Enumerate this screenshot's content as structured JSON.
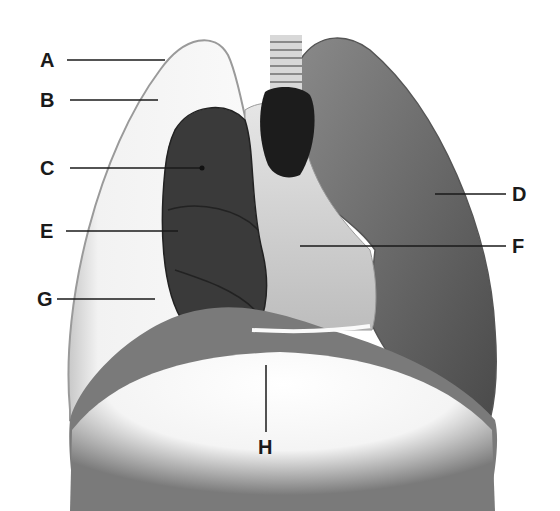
{
  "diagram": {
    "labels": [
      {
        "letter": "A",
        "x": 40,
        "y": 52
      },
      {
        "letter": "B",
        "x": 40,
        "y": 92
      },
      {
        "letter": "C",
        "x": 40,
        "y": 157
      },
      {
        "letter": "E",
        "x": 40,
        "y": 220
      },
      {
        "letter": "G",
        "x": 37,
        "y": 287
      },
      {
        "letter": "D",
        "x": 512,
        "y": 182
      },
      {
        "letter": "F",
        "x": 512,
        "y": 236
      },
      {
        "letter": "H",
        "x": 258,
        "y": 438
      }
    ]
  }
}
